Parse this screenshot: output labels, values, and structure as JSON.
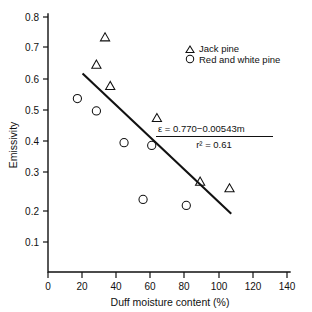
{
  "chart_data": {
    "type": "scatter",
    "title": "",
    "xlabel": "Duff moisture content (%)",
    "ylabel": "Emissivity",
    "xlim": [
      0,
      140
    ],
    "ylim": [
      0.0,
      0.8
    ],
    "xticks": [
      0,
      20,
      40,
      60,
      80,
      100,
      120,
      140
    ],
    "xtick_labels": [
      "0",
      "20",
      "40",
      "60",
      "80",
      "100",
      "120",
      "140"
    ],
    "yticks": [
      0.1,
      0.2,
      0.3,
      0.4,
      0.5,
      0.6,
      0.7,
      0.8
    ],
    "ytick_labels": [
      "0.1",
      "0.2",
      "0.3",
      "0.4",
      "0.5",
      "0.6",
      "0.7",
      "0.8"
    ],
    "grid": false,
    "legend_position": "top-right",
    "series": [
      {
        "name": "Jack pine",
        "marker": "triangle",
        "points": [
          {
            "x": 33,
            "y": 0.782
          },
          {
            "x": 28,
            "y": 0.691
          },
          {
            "x": 36,
            "y": 0.62
          },
          {
            "x": 63,
            "y": 0.513
          },
          {
            "x": 88,
            "y": 0.301
          },
          {
            "x": 105,
            "y": 0.279
          }
        ]
      },
      {
        "name": "Red and white pine",
        "marker": "circle",
        "points": [
          {
            "x": 17,
            "y": 0.578
          },
          {
            "x": 28,
            "y": 0.537
          },
          {
            "x": 44,
            "y": 0.431
          },
          {
            "x": 60,
            "y": 0.422
          },
          {
            "x": 55,
            "y": 0.242
          },
          {
            "x": 80,
            "y": 0.222
          }
        ]
      }
    ],
    "fit_line": {
      "equation": "ε = 0.770−0.00543m",
      "r_squared_text": "r² = 0.61",
      "slope": -0.00543,
      "intercept": 0.77,
      "r_squared": 0.61,
      "x_start": 20,
      "x_end": 106
    },
    "annotations": [
      {
        "text": "ε = 0.770−0.00543m"
      },
      {
        "text": "r² = 0.61"
      }
    ]
  },
  "legend": {
    "items": [
      {
        "label": "Jack pine",
        "marker": "triangle"
      },
      {
        "label": "Red and white pine",
        "marker": "circle"
      }
    ]
  },
  "axes": {
    "x_title": "Duff moisture content (%)",
    "y_title": "Emissivity",
    "x_labels": [
      "0",
      "20",
      "40",
      "60",
      "80",
      "100",
      "120",
      "140"
    ],
    "y_labels": [
      "0.1",
      "0.2",
      "0.3",
      "0.4",
      "0.5",
      "0.6",
      "0.7",
      "0.8"
    ]
  },
  "equation_box": {
    "line1": "ε = 0.770−0.00543m",
    "line2": "r² = 0.61"
  },
  "colors": {
    "ink": "#111111",
    "background": "#ffffff"
  }
}
